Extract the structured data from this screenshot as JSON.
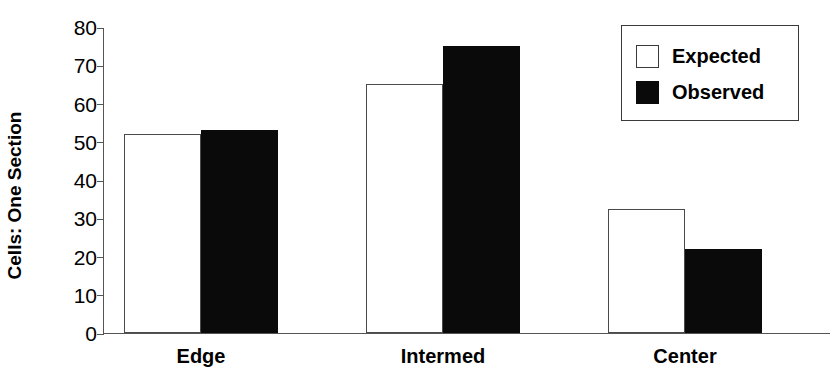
{
  "chart_data": {
    "type": "bar",
    "title": "",
    "xlabel": "",
    "ylabel": "Cells: One Section",
    "categories": [
      "Edge",
      "Intermed",
      "Center"
    ],
    "series": [
      {
        "name": "Expected",
        "color": "#ffffff",
        "values": [
          52,
          65,
          32.5
        ]
      },
      {
        "name": "Observed",
        "color": "#0a0a0a",
        "values": [
          53,
          75,
          22
        ]
      }
    ],
    "ylim": [
      0,
      80
    ],
    "yticks": [
      0,
      10,
      20,
      30,
      40,
      50,
      60,
      70,
      80
    ],
    "ytick_labels": [
      "0",
      "10",
      "20",
      "30",
      "40",
      "50",
      "60",
      "70",
      "80"
    ],
    "grid": false,
    "legend_position": "top-right",
    "bar_style": "paired-adjacent"
  },
  "legend": {
    "entries": [
      {
        "label": "Expected",
        "swatch": "open-square"
      },
      {
        "label": "Observed",
        "swatch": "filled-square"
      }
    ]
  }
}
